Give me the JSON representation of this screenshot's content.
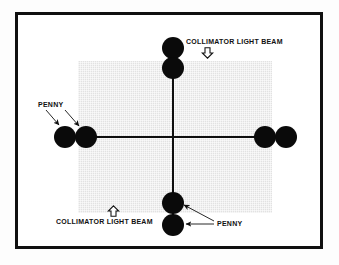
{
  "figure": {
    "type": "technical-illustration",
    "frame": {
      "border_color": "#101010",
      "background_color": "#ffffff"
    },
    "film_area": {
      "name": "film-cassette-area",
      "fill_color": "#e2e2e2"
    },
    "beam": {
      "name": "collimator-light-beam-crosshair",
      "color": "#0d0d0d",
      "lines": [
        "horizontal",
        "vertical"
      ]
    },
    "labels": {
      "collimator_top": "COLLIMATOR LIGHT BEAM",
      "collimator_bottom": "COLLIMATOR LIGHT BEAM",
      "penny_left": "PENNY",
      "penny_bottom": "PENNY"
    },
    "icons": {
      "arrow_down": "arrow-down-hollow-icon",
      "arrow_up": "arrow-up-hollow-icon"
    },
    "pennies": [
      {
        "id": "penny-top-outer",
        "cx": 170,
        "cy": 45,
        "r": 11
      },
      {
        "id": "penny-top-inner",
        "cx": 170,
        "cy": 65,
        "r": 11
      },
      {
        "id": "penny-left-outer",
        "cx": 62,
        "cy": 134,
        "r": 11
      },
      {
        "id": "penny-left-inner",
        "cx": 83,
        "cy": 134,
        "r": 11
      },
      {
        "id": "penny-right-inner",
        "cx": 262,
        "cy": 134,
        "r": 11
      },
      {
        "id": "penny-right-outer",
        "cx": 283,
        "cy": 134,
        "r": 11
      },
      {
        "id": "penny-bottom-inner",
        "cx": 170,
        "cy": 200,
        "r": 11
      },
      {
        "id": "penny-bottom-outer",
        "cx": 170,
        "cy": 222,
        "r": 11
      }
    ],
    "leaders": [
      {
        "id": "leader-penny-left-a",
        "from": [
          54,
          108
        ],
        "to": [
          60,
          123
        ]
      },
      {
        "id": "leader-penny-left-b",
        "from": [
          70,
          108
        ],
        "to": [
          80,
          124
        ]
      },
      {
        "id": "leader-penny-bottom-a",
        "from": [
          214,
          221
        ],
        "to": [
          184,
          203
        ]
      },
      {
        "id": "leader-penny-bottom-b",
        "from": [
          214,
          223
        ],
        "to": [
          186,
          221
        ]
      }
    ]
  }
}
